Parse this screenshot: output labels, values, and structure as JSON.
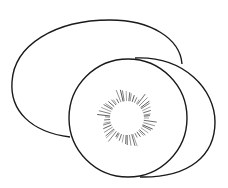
{
  "image": {
    "subject": "Kiwi fruit line drawing",
    "description": "Outline illustration of a whole kiwi and a sliced kiwi half with seeds",
    "stroke_color": "#1a1a1a",
    "background_color": "#ffffff"
  }
}
